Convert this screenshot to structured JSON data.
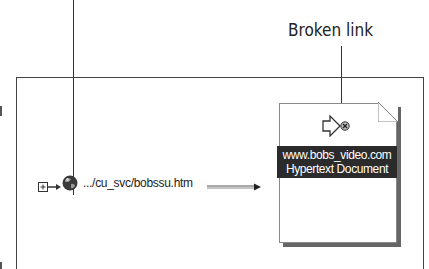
{
  "callouts": {
    "broken_link_label": "Broken link"
  },
  "site_map": {
    "source_node": {
      "expand_icon": "plus-box-icon",
      "page_icon": "globe-icon",
      "path": ".../cu_svc/bobssu.htm"
    },
    "target_node": {
      "status_icon": "broken-link-icon",
      "title_line": "www.bobs_video.com",
      "type_line": "Hypertext Document"
    }
  },
  "colors": {
    "label_background": "#2b2b2b",
    "label_text": "#ffffff",
    "lines": "#333333"
  }
}
